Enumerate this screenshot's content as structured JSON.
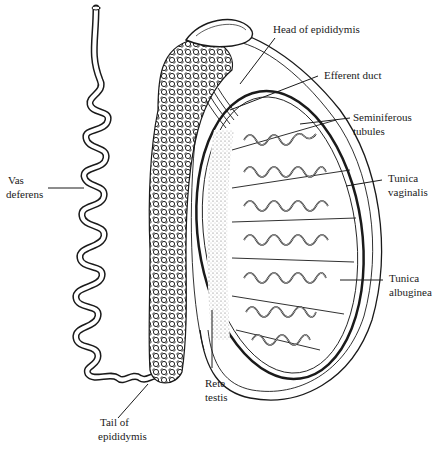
{
  "diagram": {
    "labels": {
      "head_of_epididymis": "Head of epididymis",
      "efferent_duct": "Efferent duct",
      "seminiferous_1": "Seminiferous",
      "seminiferous_2": "tubules",
      "tunica_vaginalis_1": "Tunica",
      "tunica_vaginalis_2": "vaginalis",
      "tunica_albuginea_1": "Tunica",
      "tunica_albuginea_2": "albuginea",
      "vas_deferens_1": "Vas",
      "vas_deferens_2": "deferens",
      "rete_testis_1": "Rete",
      "rete_testis_2": "testis",
      "tail_of_epididymis_1": "Tail of",
      "tail_of_epididymis_2": "epididymis"
    },
    "colors": {
      "ink": "#1a1a1a",
      "background": "#ffffff"
    }
  }
}
